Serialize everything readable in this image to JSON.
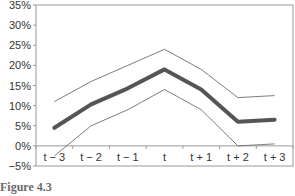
{
  "chart_data": {
    "type": "line",
    "title": "",
    "xlabel": "",
    "ylabel": "",
    "categories": [
      "t − 3",
      "t − 2",
      "t − 1",
      "t",
      "t + 1",
      "t + 2",
      "t + 3"
    ],
    "y_ticks": [
      "35%",
      "30%",
      "25%",
      "20%",
      "15%",
      "10%",
      "5%",
      "0%",
      "−5%"
    ],
    "ylim": [
      -5,
      35
    ],
    "grid": false,
    "legend": "none",
    "series": [
      {
        "name": "upper band",
        "style": "thin",
        "values": [
          11,
          16,
          20,
          24,
          19,
          12,
          12.5
        ]
      },
      {
        "name": "central estimate",
        "style": "thick",
        "values": [
          4.5,
          10.3,
          14.3,
          19,
          14,
          6,
          6.5
        ]
      },
      {
        "name": "lower band",
        "style": "thin",
        "values": [
          -2.5,
          5,
          9,
          14,
          9,
          0,
          0.5
        ]
      }
    ]
  },
  "caption": "Figure 4.3"
}
